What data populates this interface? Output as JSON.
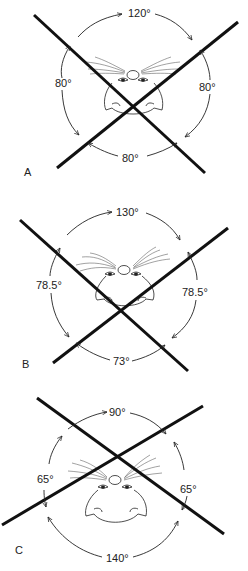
{
  "panels": [
    {
      "id": "A",
      "label": "A",
      "angles": {
        "top": "120°",
        "left": "80°",
        "right": "80°",
        "bottom": "80°"
      }
    },
    {
      "id": "B",
      "label": "B",
      "angles": {
        "top": "130°",
        "left": "78.5°",
        "right": "78.5°",
        "bottom": "73°"
      }
    },
    {
      "id": "C",
      "label": "C",
      "angles": {
        "top": "90°",
        "left": "65°",
        "right": "65°",
        "bottom": "140°"
      }
    }
  ],
  "colors": {
    "line": "#111111",
    "background": "#ffffff"
  }
}
